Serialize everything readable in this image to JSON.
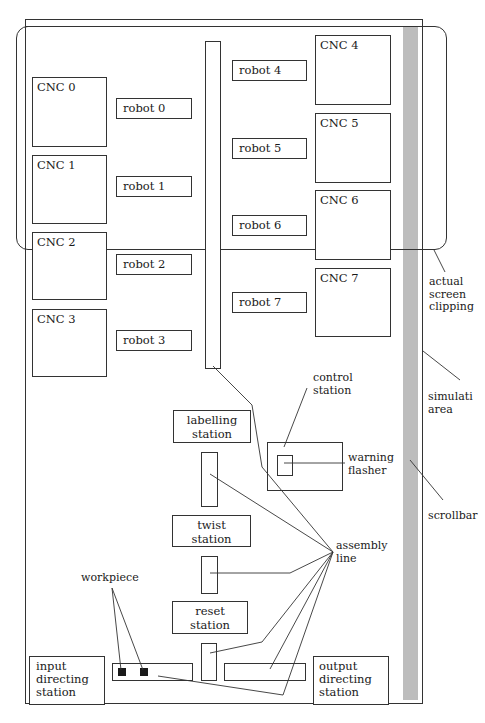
{
  "cnc_machines": [
    {
      "label": "CNC 0"
    },
    {
      "label": "CNC 1"
    },
    {
      "label": "CNC 2"
    },
    {
      "label": "CNC 3"
    },
    {
      "label": "CNC 4"
    },
    {
      "label": "CNC 5"
    },
    {
      "label": "CNC 6"
    },
    {
      "label": "CNC 7"
    }
  ],
  "robots": [
    {
      "label": "robot 0"
    },
    {
      "label": "robot 1"
    },
    {
      "label": "robot 2"
    },
    {
      "label": "robot 3"
    },
    {
      "label": "robot 4"
    },
    {
      "label": "robot 5"
    },
    {
      "label": "robot 6"
    },
    {
      "label": "robot 7"
    }
  ],
  "stations": {
    "labelling": "labelling\nstation",
    "twist": "twist\nstation",
    "reset": "reset\nstation",
    "input_directing": "input\ndirecting\nstation",
    "output_directing": "output\ndirecting\nstation"
  },
  "annotations": {
    "actual_screen_clipping": "actual\nscreen\nclipping",
    "simulation_area": "simulati\narea",
    "scrollbar": "scrollbar",
    "control_station": "control\nstation",
    "warning_flasher": "warning\nflasher",
    "assembly_line": "assembly\nline",
    "workpiece": "workpiece"
  },
  "colors": {
    "line": "#333333",
    "scrollbar": "#bdbdbd",
    "workpiece": "#1a1a1a"
  }
}
